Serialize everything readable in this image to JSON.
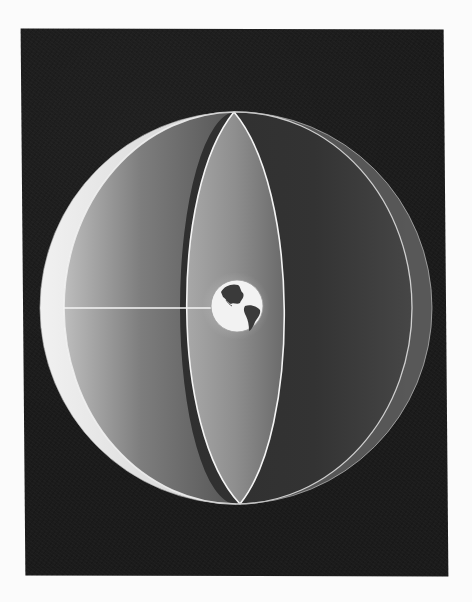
{
  "figure": {
    "colors": {
      "page_background": "#fbfbfb",
      "plate_background": "#1b1b1b",
      "sphere_light": "#e8e8e8",
      "sphere_mid": "#8a8a8a",
      "sphere_dark": "#2e2e2e",
      "rim_line": "#f4f4f4",
      "earth_ocean": "#f2f2f2",
      "earth_land": "#3a3a3a"
    },
    "earth_label": "Earth",
    "radius_line_label": "radius"
  }
}
